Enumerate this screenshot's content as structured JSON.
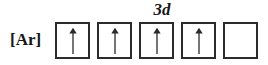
{
  "diagram": {
    "type": "orbital-box-diagram",
    "core_label": "[Ar]",
    "subshell_label": "3d",
    "subshell_label_center_x": 162,
    "background_color": "#ffffff",
    "box_border_color": "#2b2b2b",
    "arrow_color": "#2b2b2b",
    "text_color": "#161616",
    "boxes": [
      {
        "index": 1,
        "electrons": 1,
        "spins": [
          "up"
        ],
        "occupied": true
      },
      {
        "index": 2,
        "electrons": 1,
        "spins": [
          "up"
        ],
        "occupied": true
      },
      {
        "index": 3,
        "electrons": 1,
        "spins": [
          "up"
        ],
        "occupied": true
      },
      {
        "index": 4,
        "electrons": 1,
        "spins": [
          "up"
        ],
        "occupied": true
      },
      {
        "index": 5,
        "electrons": 0,
        "spins": [],
        "occupied": false
      }
    ]
  }
}
